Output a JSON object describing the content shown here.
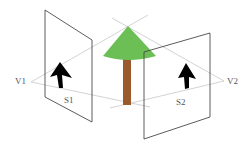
{
  "diagram": {
    "title": "",
    "labels": {
      "v1": "V1",
      "v2": "V2",
      "s1": "S1",
      "s2": "S2"
    },
    "colors": {
      "background": "#ffffff",
      "panel_stroke": "#4a4a4a",
      "ray_stroke": "#c8c8c8",
      "tree_foliage": "#6cbf55",
      "tree_trunk": "#9a5a2e",
      "arrow_fill": "#000000",
      "label_text": "#555555"
    },
    "elements": [
      {
        "id": "viewpoint-1",
        "label": "V1",
        "type": "viewpoint"
      },
      {
        "id": "screen-1",
        "label": "S1",
        "type": "image-plane",
        "content": "upward arrow (projected tree)"
      },
      {
        "id": "tree",
        "type": "object",
        "content": "cone tree with brown trunk"
      },
      {
        "id": "screen-2",
        "label": "S2",
        "type": "image-plane",
        "content": "upward arrow (projected tree)"
      },
      {
        "id": "viewpoint-2",
        "label": "V2",
        "type": "viewpoint"
      }
    ]
  }
}
